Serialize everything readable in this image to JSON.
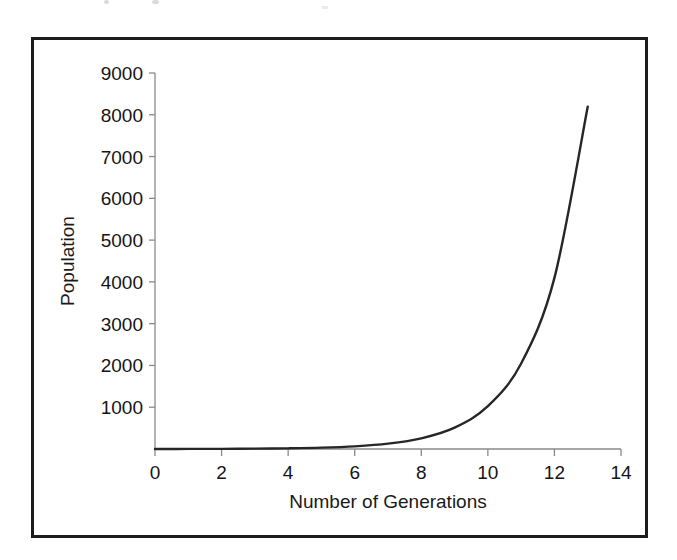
{
  "figure": {
    "frame_color": "#1c1c1c",
    "background": "#ffffff"
  },
  "chart_data": {
    "type": "line",
    "title": "",
    "xlabel": "Number of Generations",
    "ylabel": "Population",
    "xlim": [
      0,
      14
    ],
    "ylim": [
      0,
      9000
    ],
    "grid": false,
    "legend": null,
    "series_color": "#262626",
    "axis_color": "#8a8a8a",
    "xticks": [
      "0",
      "2",
      "4",
      "6",
      "8",
      "10",
      "12",
      "14"
    ],
    "xtick_values": [
      0,
      2,
      4,
      6,
      8,
      10,
      12,
      14
    ],
    "yticks": [
      "1000",
      "2000",
      "3000",
      "4000",
      "5000",
      "6000",
      "7000",
      "8000",
      "9000"
    ],
    "ytick_values": [
      1000,
      2000,
      3000,
      4000,
      5000,
      6000,
      7000,
      8000,
      9000
    ],
    "series": [
      {
        "name": "Population",
        "x": [
          0,
          1,
          2,
          3,
          4,
          5,
          6,
          7,
          8,
          9,
          10,
          11,
          12,
          13
        ],
        "values": [
          1,
          2,
          4,
          8,
          16,
          32,
          64,
          128,
          256,
          512,
          1024,
          2048,
          4096,
          8192
        ]
      }
    ]
  }
}
